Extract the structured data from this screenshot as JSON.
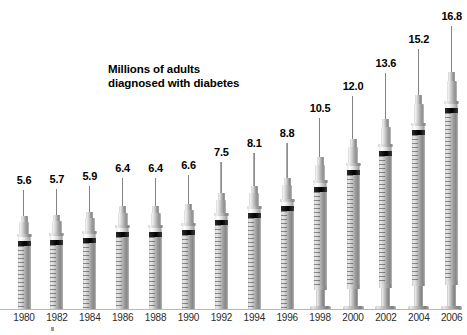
{
  "chart_data": {
    "type": "bar",
    "title": "Millions of adults diagnosed with diabetes",
    "title_lines": [
      "Millions of adults",
      "diagnosed with diabetes"
    ],
    "xlabel": "",
    "ylabel": "Millions of adults",
    "ylim": [
      0,
      16.8
    ],
    "grid": false,
    "legend": null,
    "units": "millions of adults",
    "glyph": "syringe",
    "categories": [
      "1980",
      "1982",
      "1984",
      "1986",
      "1988",
      "1990",
      "1992",
      "1994",
      "1996",
      "1998",
      "2000",
      "2002",
      "2004",
      "2006"
    ],
    "values": [
      5.6,
      5.7,
      5.9,
      6.4,
      6.4,
      6.6,
      7.5,
      8.1,
      8.8,
      10.5,
      12.0,
      13.6,
      15.2,
      16.8
    ],
    "value_labels": [
      "5.6",
      "5.7",
      "5.9",
      "6.4",
      "6.4",
      "6.6",
      "7.5",
      "8.1",
      "8.8",
      "10.5",
      "12.0",
      "13.6",
      "15.2",
      "16.8"
    ]
  },
  "colors": {
    "background": "#ffffff",
    "text": "#000000",
    "axis_label": "#2b2b2b",
    "syringe_body": "#b0b0b0",
    "syringe_highlight": "#efefef",
    "syringe_shadow": "#868686",
    "stopper_band": "#000000"
  }
}
